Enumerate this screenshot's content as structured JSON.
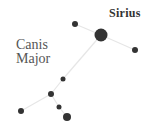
{
  "constellation": {
    "name_line1": "Canis",
    "name_line2": "Major",
    "highlight_star": "Sirius"
  },
  "colors": {
    "star": "#333333",
    "line": "#e6e6e6",
    "label": "#555555",
    "highlight_label": "#333333"
  },
  "stars": [
    {
      "id": "sirius",
      "x": 101,
      "y": 35,
      "r": 6.5
    },
    {
      "id": "star-nw",
      "x": 75,
      "y": 24,
      "r": 3
    },
    {
      "id": "star-e",
      "x": 135,
      "y": 50,
      "r": 3
    },
    {
      "id": "star-mid",
      "x": 63,
      "y": 79,
      "r": 2.5
    },
    {
      "id": "star-hip",
      "x": 51,
      "y": 94,
      "r": 3
    },
    {
      "id": "star-sw",
      "x": 21,
      "y": 111,
      "r": 3
    },
    {
      "id": "star-s1",
      "x": 59,
      "y": 107,
      "r": 2.5
    },
    {
      "id": "star-s2",
      "x": 67,
      "y": 117,
      "r": 4
    }
  ],
  "connections": [
    [
      "sirius",
      "star-nw"
    ],
    [
      "sirius",
      "star-e"
    ],
    [
      "sirius",
      "star-mid"
    ],
    [
      "star-mid",
      "star-hip"
    ],
    [
      "star-hip",
      "star-sw"
    ],
    [
      "star-hip",
      "star-s1"
    ],
    [
      "star-s1",
      "star-s2"
    ]
  ]
}
